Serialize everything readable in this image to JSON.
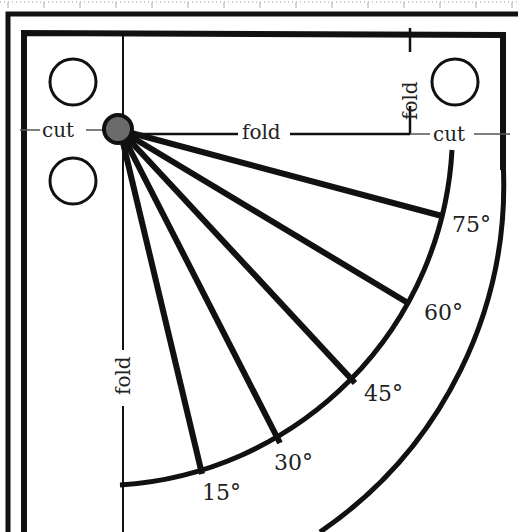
{
  "diagram": {
    "pivot_color": "#6b6b6b",
    "line_color": "#111111",
    "labels": {
      "cut_left": "cut",
      "cut_right": "cut",
      "fold_horizontal": "fold",
      "fold_top_vertical": "fold",
      "fold_left_vertical": "fold"
    },
    "angles": [
      {
        "label": "15°",
        "deg": 15
      },
      {
        "label": "30°",
        "deg": 30
      },
      {
        "label": "45°",
        "deg": 45
      },
      {
        "label": "60°",
        "deg": 60
      },
      {
        "label": "75°",
        "deg": 75
      }
    ],
    "holes": [
      {
        "name": "hole-top-left"
      },
      {
        "name": "hole-mid-left"
      },
      {
        "name": "hole-top-right"
      }
    ]
  }
}
